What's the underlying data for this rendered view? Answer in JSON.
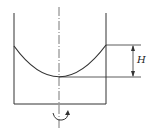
{
  "diagram": {
    "labels": {
      "height": "H"
    },
    "colors": {
      "stroke": "#333333",
      "background": "#ffffff"
    },
    "geometry": {
      "left_wall_x": 14,
      "right_wall_x": 106,
      "wall_top_y": 13,
      "bottom_y": 104,
      "axis_x": 59,
      "rim_left_y": 46,
      "rim_right_y": 45,
      "vertex_y": 77,
      "dim_arrow_x": 133
    }
  }
}
